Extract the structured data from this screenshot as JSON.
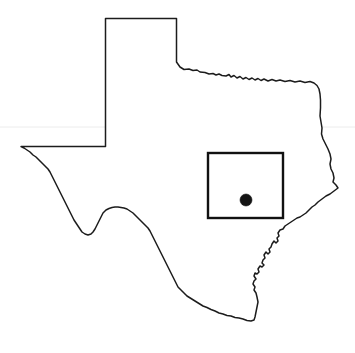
{
  "figure": {
    "width": 355,
    "height": 353,
    "background_color": "#ffffff",
    "style": "line-art outline map, no labels"
  },
  "map": {
    "region_name": "Texas",
    "outline_color": "#1c1c1c",
    "outline_stroke_width": 1.5,
    "fill_color": "#ffffff",
    "bounds": {
      "x": 21,
      "y": 18,
      "width": 317,
      "height": 304
    },
    "features": [
      {
        "name": "panhandle",
        "description": "northern rectangular panhandle"
      },
      {
        "name": "red-river-border",
        "description": "wiggly northern border with Oklahoma"
      },
      {
        "name": "sabine-river-border",
        "description": "eastern border with Louisiana"
      },
      {
        "name": "gulf-coast",
        "description": "jagged southeastern Gulf of Mexico coastline"
      },
      {
        "name": "rio-grande-border",
        "description": "southwestern border with Mexico"
      },
      {
        "name": "new-mexico-border",
        "description": "straight western and southern New Mexico border"
      }
    ]
  },
  "inset_box": {
    "label": "study-area-rectangle",
    "x": 208,
    "y": 153,
    "width": 75,
    "height": 65,
    "stroke_color": "#111111",
    "stroke_width": 2.4,
    "fill": "none"
  },
  "site_marker": {
    "label": "site-location-dot",
    "shape": "filled-circle",
    "cx": 246,
    "cy": 200,
    "radius": 6,
    "color": "#141414"
  },
  "artifacts": {
    "scan_line": {
      "label": "faint-horizontal-scan-line",
      "y": 127,
      "color": "#ececec"
    }
  }
}
